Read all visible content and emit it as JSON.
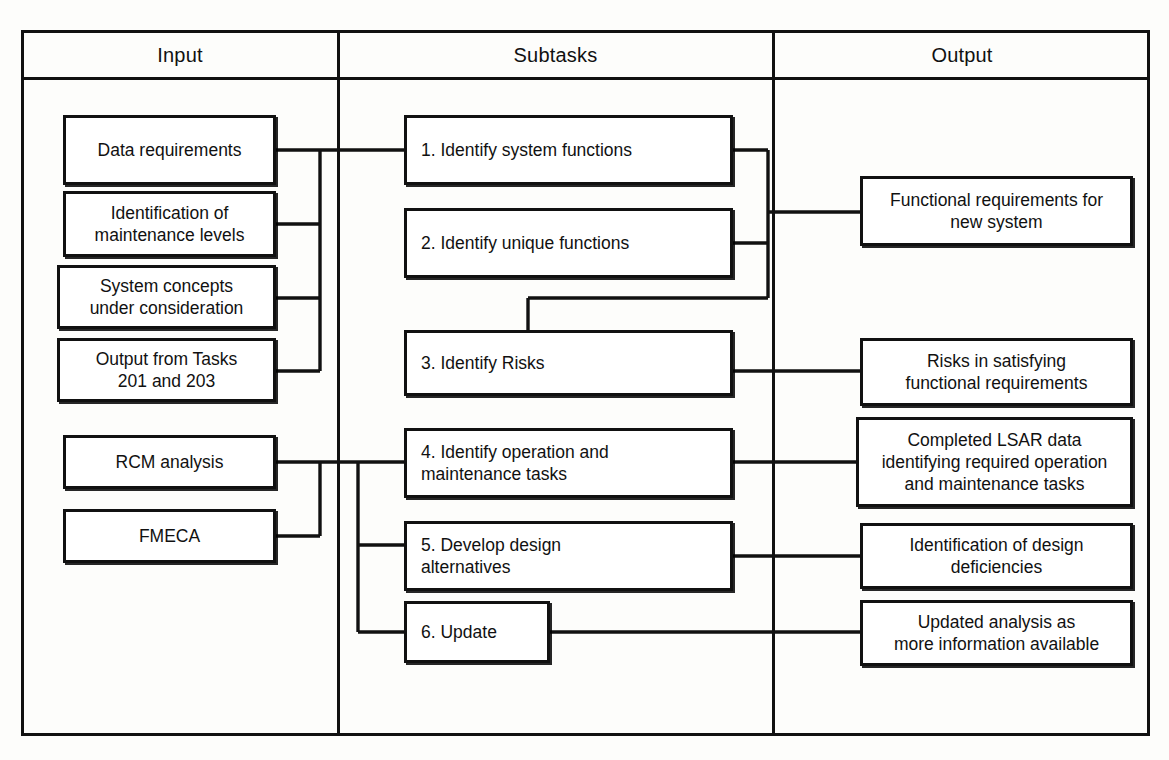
{
  "diagram": {
    "columns": [
      {
        "id": "input",
        "label": "Input"
      },
      {
        "id": "subtasks",
        "label": "Subtasks"
      },
      {
        "id": "output",
        "label": "Output"
      }
    ]
  },
  "input_nodes": [
    {
      "id": "data-requirements",
      "label": "Data requirements"
    },
    {
      "id": "maintenance-levels",
      "label": "Identification of\nmaintenance levels"
    },
    {
      "id": "system-concepts",
      "label": "System  concepts\nunder  consideration"
    },
    {
      "id": "output-from-tasks",
      "label": "Output from Tasks\n201 and 203"
    },
    {
      "id": "rcm-analysis",
      "label": "RCM analysis"
    },
    {
      "id": "fmeca",
      "label": "FMECA"
    }
  ],
  "subtask_nodes": [
    {
      "id": "subtask-1",
      "label": "1. Identify system functions"
    },
    {
      "id": "subtask-2",
      "label": "2. Identify unique functions"
    },
    {
      "id": "subtask-3",
      "label": "3. Identify Risks"
    },
    {
      "id": "subtask-4",
      "label": "4. Identify operation and\n      maintenance tasks"
    },
    {
      "id": "subtask-5",
      "label": "5.  Develop  design\n      alternatives"
    },
    {
      "id": "subtask-6",
      "label": "6. Update"
    }
  ],
  "output_nodes": [
    {
      "id": "functional-requirements",
      "label": "Functional requirements for\nnew system"
    },
    {
      "id": "risks-satisfying",
      "label": "Risks in satisfying\nfunctional requirements"
    },
    {
      "id": "completed-lsar",
      "label": "Completed LSAR data\nidentifying required operation\nand maintenance tasks"
    },
    {
      "id": "design-deficiencies",
      "label": "Identification of design\ndeficiencies"
    },
    {
      "id": "updated-analysis",
      "label": "Updated analysis as\nmore information available"
    }
  ],
  "style": {
    "line_color": "#111111",
    "background": "#fdfdfb",
    "node_fill": "#ffffff"
  }
}
